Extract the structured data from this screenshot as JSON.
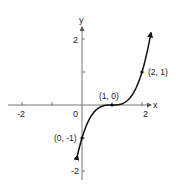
{
  "chart_data": {
    "type": "line",
    "title": "",
    "function": "y = (x - 1)^3",
    "xlabel": "x",
    "ylabel": "y",
    "xlim": [
      -2.5,
      2.5
    ],
    "ylim": [
      -2.3,
      2.3
    ],
    "grid": false,
    "x_ticks": [
      -2,
      -1,
      1,
      2
    ],
    "x_tick_labels": [
      {
        "value": -2,
        "label": "-2"
      },
      {
        "value": 0,
        "label": "0"
      },
      {
        "value": 2,
        "label": "2"
      }
    ],
    "y_ticks": [
      -2,
      -1,
      1,
      2
    ],
    "y_tick_labels": [
      {
        "value": 2,
        "label": "2"
      },
      {
        "value": -2,
        "label": "-2"
      }
    ],
    "series": [
      {
        "name": "y = (x - 1)^3",
        "x_range": [
          -0.15,
          2.3
        ],
        "arrows": "both",
        "color": "#111111"
      }
    ],
    "points": [
      {
        "x": 0,
        "y": -1,
        "label": "(0, -1)"
      },
      {
        "x": 1,
        "y": 0,
        "label": "(1, 0)"
      },
      {
        "x": 2,
        "y": 1,
        "label": "(2, 1)"
      }
    ]
  },
  "labels": {
    "x_axis": "x",
    "y_axis": "y",
    "origin": "0",
    "x_neg2": "-2",
    "x_pos2": "2",
    "y_pos2": "2",
    "y_neg2": "-2",
    "p1": "(0, -1)",
    "p2": "(1, 0)",
    "p3": "(2, 1)"
  }
}
